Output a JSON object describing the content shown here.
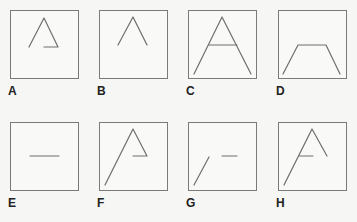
{
  "figure": {
    "stroke_color": "#6e6e6e",
    "box_border_color": "#7a7a7a",
    "background_color": "#f6f6f4",
    "panels": [
      {
        "label": "A",
        "description": "Triangle outline with left side, right side, and partial bottom edge from right corner to center",
        "strokes": [
          {
            "type": "polyline",
            "points": "19,37 34,8 48,37 34,37"
          }
        ]
      },
      {
        "label": "B",
        "description": "Inverted V (caret) shape",
        "strokes": [
          {
            "type": "polyline",
            "points": "19,35 34,7 48,35"
          }
        ]
      },
      {
        "label": "C",
        "description": "Large letter A shape with crossbar",
        "strokes": [
          {
            "type": "polyline",
            "points": "6,64 34,7 63,64"
          },
          {
            "type": "line",
            "points": "21,35 49,35"
          }
        ]
      },
      {
        "label": "D",
        "description": "Trapezoid outline open at the bottom",
        "strokes": [
          {
            "type": "polyline",
            "points": "5,64 20,35 48,35 62,64"
          }
        ]
      },
      {
        "label": "E",
        "description": "Single short horizontal line",
        "strokes": [
          {
            "type": "line",
            "points": "20,34 49,34"
          }
        ]
      },
      {
        "label": "F",
        "description": "Long left diagonal to apex, right side down, horizontal back to center",
        "strokes": [
          {
            "type": "polyline",
            "points": "6,63 34,7 48,34 34,34"
          }
        ]
      },
      {
        "label": "G",
        "description": "Short lower-left diagonal and separate short horizontal line",
        "strokes": [
          {
            "type": "line",
            "points": "6,63 21,35"
          },
          {
            "type": "line",
            "points": "34,34 49,34"
          }
        ]
      },
      {
        "label": "H",
        "description": "Long left diagonal to apex, right side down, with short crossbar on the left",
        "strokes": [
          {
            "type": "polyline",
            "points": "6,63 34,7 49,34"
          },
          {
            "type": "line",
            "points": "21,34 35,34"
          }
        ]
      }
    ]
  }
}
